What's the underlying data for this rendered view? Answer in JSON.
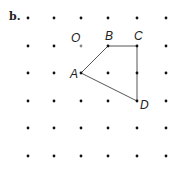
{
  "figure": {
    "part_label": "b.",
    "grid": {
      "cols": 6,
      "rows": 6,
      "x": [
        28,
        54,
        81,
        108,
        137,
        166
      ],
      "y": [
        18,
        46,
        73,
        101,
        128,
        156
      ],
      "dot_color": "#111111"
    },
    "points": [
      {
        "name": "O",
        "col": 2,
        "row": 1,
        "color": "#888888",
        "label_dx": -10,
        "label_dy": -4
      },
      {
        "name": "B",
        "col": 3,
        "row": 1,
        "color": "#111111",
        "label_dx": -3,
        "label_dy": -6
      },
      {
        "name": "C",
        "col": 4,
        "row": 1,
        "color": "#111111",
        "label_dx": -3,
        "label_dy": -6
      },
      {
        "name": "A",
        "col": 2,
        "row": 2,
        "color": "#111111",
        "label_dx": -11,
        "label_dy": 5
      },
      {
        "name": "D",
        "col": 4,
        "row": 3,
        "color": "#111111",
        "label_dx": 3,
        "label_dy": 8
      }
    ],
    "polygon": {
      "vertices": [
        "A",
        "B",
        "C",
        "D"
      ],
      "stroke": "#555555"
    }
  }
}
